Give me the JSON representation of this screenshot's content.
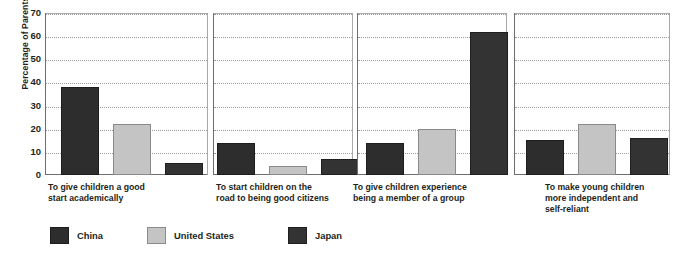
{
  "chart_data": {
    "type": "bar",
    "title": "",
    "subtitle": "",
    "xlabel": "",
    "ylabel": "Percentage of Parents Agreeing",
    "ylim": [
      0,
      70
    ],
    "yticks": [
      0,
      10,
      20,
      30,
      40,
      50,
      60,
      70
    ],
    "ytick_labels": [
      "0",
      "10",
      "20",
      "30",
      "40",
      "50",
      "60",
      "70"
    ],
    "grid": true,
    "legend_position": "bottom-left",
    "panel_layout": "4 side-by-side panels, one per category",
    "categories": [
      "To give children a good start academically",
      "To start children on the road to being good citizens",
      "To give children experience being a member of a group",
      "To make young children more independent and self-reliant"
    ],
    "category_lines": [
      [
        "To give children a good",
        "start academically"
      ],
      [
        "To start children on the",
        "road to being good citizens"
      ],
      [
        "To give children experience",
        "being a member of a group"
      ],
      [
        "To make young children",
        "more independent and",
        "self-reliant"
      ]
    ],
    "series": [
      {
        "name": "China",
        "color": "#2d2d2d",
        "values": [
          38,
          14,
          14,
          15
        ]
      },
      {
        "name": "United States",
        "color": "#c4c4c4",
        "values": [
          22,
          4,
          20,
          22
        ]
      },
      {
        "name": "Japan",
        "color": "#333333",
        "values": [
          5,
          7,
          62,
          16
        ]
      }
    ]
  },
  "legend": {
    "items": [
      {
        "label": "China",
        "swatch": "china"
      },
      {
        "label": "United States",
        "swatch": "us"
      },
      {
        "label": "Japan",
        "swatch": "japan"
      }
    ]
  }
}
